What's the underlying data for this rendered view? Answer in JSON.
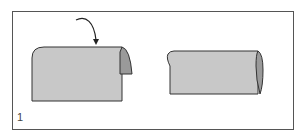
{
  "diagram": {
    "step_number": "1",
    "colors": {
      "frame": "#555555",
      "paper_face": "#c8c8c8",
      "paper_back": "#9a9a9a",
      "outline": "#333333",
      "background": "#ffffff"
    },
    "panels": [
      {
        "id": "before-fold",
        "description": "sheet with top edge curling over to the back, arrow indicating fold direction"
      },
      {
        "id": "after-fold",
        "description": "sheet rolled into a tube/cylinder shape"
      }
    ],
    "arrow": {
      "direction": "curving downward",
      "meaning": "fold over"
    }
  }
}
